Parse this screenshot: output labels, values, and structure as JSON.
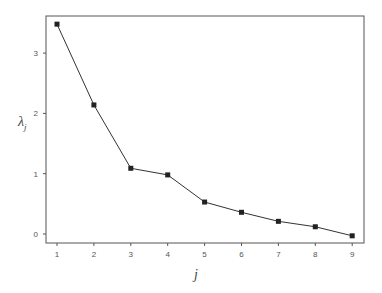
{
  "chart_data": {
    "type": "line",
    "title": "",
    "xlabel": "j",
    "ylabel": "λ_j",
    "ylabel_main": "λ",
    "ylabel_sub": "j",
    "x": [
      1,
      2,
      3,
      4,
      5,
      6,
      7,
      8,
      9
    ],
    "series": [
      {
        "name": "eigenvalues",
        "values": [
          3.48,
          2.14,
          1.09,
          0.98,
          0.53,
          0.36,
          0.21,
          0.12,
          -0.03
        ],
        "marker": "square",
        "color": "#222222"
      }
    ],
    "xticks": [
      1,
      2,
      3,
      4,
      5,
      6,
      7,
      8,
      9
    ],
    "yticks": [
      0,
      1,
      2,
      3
    ],
    "xlim": [
      0.7,
      9.3
    ],
    "ylim": [
      -0.15,
      3.6
    ],
    "grid": false,
    "legend": null
  }
}
